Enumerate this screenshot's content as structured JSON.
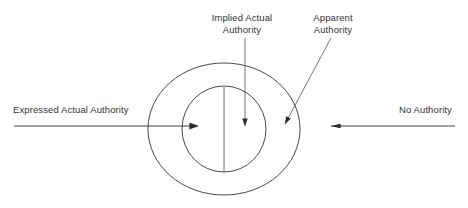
{
  "diagram": {
    "type": "concentric-ellipse-venn",
    "background_color": "#ffffff",
    "stroke_color": "#3a3a3a",
    "text_color": "#333333",
    "labels": {
      "implied_actual_authority": "Implied Actual\nAuthority",
      "implied_actual_authority_line1": "Implied Actual",
      "implied_actual_authority_line2": "Authority",
      "apparent_authority": "Apparent\nAuthority",
      "apparent_authority_line1": "Apparent",
      "apparent_authority_line2": "Authority",
      "expressed_actual_authority": "Expressed Actual Authority",
      "no_authority": "No Authority"
    },
    "shapes": [
      {
        "name": "outer-ellipse",
        "meaning": "apparent-authority-region",
        "cx": 224,
        "cy": 129,
        "rx": 76,
        "ry": 66
      },
      {
        "name": "inner-ellipse",
        "meaning": "actual-authority-region",
        "cx": 224,
        "cy": 129,
        "rx": 42,
        "ry": 43
      },
      {
        "name": "vertical-divider",
        "meaning": "splits-actual-authority-into-expressed-and-implied",
        "x1": 224,
        "y1": 86,
        "x2": 224,
        "y2": 172
      }
    ],
    "arrows": [
      {
        "name": "expressed-actual-authority-arrow",
        "x1": 14,
        "y1": 126,
        "x2": 200,
        "y2": 126,
        "direction": "right",
        "points_to": "left half of inner ellipse"
      },
      {
        "name": "implied-actual-authority-arrow",
        "x1": 245,
        "y1": 38,
        "x2": 245,
        "y2": 128,
        "direction": "down",
        "points_to": "right half of inner ellipse"
      },
      {
        "name": "apparent-authority-arrow",
        "x1": 330,
        "y1": 38,
        "x2": 284,
        "y2": 126,
        "direction": "down-left",
        "points_to": "ring between inner and outer ellipse"
      },
      {
        "name": "no-authority-arrow",
        "x1": 455,
        "y1": 126,
        "x2": 330,
        "y2": 126,
        "direction": "left",
        "points_to": "area outside outer ellipse"
      }
    ]
  }
}
